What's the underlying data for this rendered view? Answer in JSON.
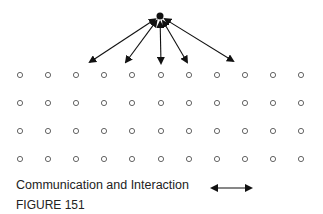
{
  "diagram": {
    "teacher": {
      "x": 160,
      "y": 16
    },
    "arrow_targets": [
      {
        "x": 90,
        "y": 62
      },
      {
        "x": 126,
        "y": 62
      },
      {
        "x": 161,
        "y": 63
      },
      {
        "x": 187,
        "y": 62
      },
      {
        "x": 233,
        "y": 61
      }
    ],
    "grid": {
      "columns": 11,
      "rows": 4,
      "col_x": [
        20,
        48,
        76,
        104,
        132,
        161,
        189,
        217,
        245,
        273,
        301
      ],
      "row_y": [
        75,
        103,
        131,
        159
      ]
    }
  },
  "legend": {
    "label": "Communication and Interaction",
    "symbol": "double-headed-arrow"
  },
  "caption": "FIGURE 151"
}
